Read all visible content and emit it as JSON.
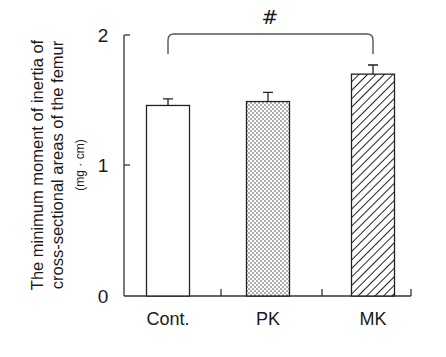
{
  "chart_data": {
    "type": "bar",
    "title": "",
    "xlabel": "",
    "ylabel": "The minimum moment of inertia of cross-sectional areas of the femur (mg · cm)",
    "ylabel_lines": [
      "The minimum moment of inertia of",
      "cross-sectional areas of the femur"
    ],
    "ylabel_unit": "(mg · cm)",
    "ylim": [
      0,
      2
    ],
    "yticks": [
      0,
      1,
      2
    ],
    "ytick_labels": [
      "0",
      "1",
      "2"
    ],
    "categories": [
      "Cont.",
      "PK",
      "MK"
    ],
    "values": [
      1.46,
      1.49,
      1.7
    ],
    "errors": [
      0.05,
      0.07,
      0.07
    ],
    "fills": [
      "white",
      "dotted",
      "hatched"
    ],
    "grid": false,
    "legend": null,
    "annotations": [
      {
        "type": "significance-bracket",
        "from": "Cont.",
        "to": "MK",
        "label": "#"
      }
    ]
  },
  "colors": {
    "ink": "#1a1a1a",
    "background": "#ffffff"
  }
}
